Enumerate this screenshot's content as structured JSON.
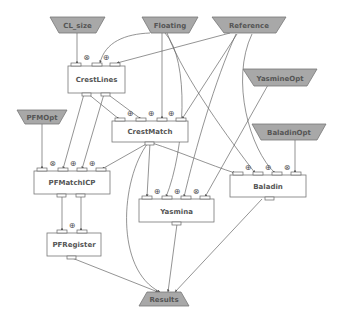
{
  "diagram": {
    "type": "workflow",
    "inputs": [
      {
        "id": "cl_size",
        "label": "CL_size"
      },
      {
        "id": "floating",
        "label": "Floating"
      },
      {
        "id": "reference",
        "label": "Reference"
      },
      {
        "id": "yasmine_opt",
        "label": "YasmineOpt"
      },
      {
        "id": "pfm_opt",
        "label": "PFMOpt"
      },
      {
        "id": "baladin_opt",
        "label": "BaladinOpt"
      }
    ],
    "processors": [
      {
        "id": "crestlines",
        "label": "CrestLines"
      },
      {
        "id": "crestmatch",
        "label": "CrestMatch"
      },
      {
        "id": "pfmatchicp",
        "label": "PFMatchICP"
      },
      {
        "id": "baladin",
        "label": "Baladin"
      },
      {
        "id": "yasmina",
        "label": "Yasmina"
      },
      {
        "id": "pfregister",
        "label": "PFRegister"
      }
    ],
    "outputs": [
      {
        "id": "results",
        "label": "Results"
      }
    ],
    "operators": {
      "cross": "⊗",
      "dot": "⊕"
    },
    "edges": [
      [
        "CL_size",
        "CrestLines"
      ],
      [
        "Floating",
        "CrestLines"
      ],
      [
        "Reference",
        "CrestLines"
      ],
      [
        "CrestLines",
        "CrestMatch"
      ],
      [
        "CrestLines",
        "CrestMatch"
      ],
      [
        "Floating",
        "CrestMatch"
      ],
      [
        "Reference",
        "CrestMatch"
      ],
      [
        "CrestLines",
        "PFMatchICP"
      ],
      [
        "PFMOpt",
        "PFMatchICP"
      ],
      [
        "CrestMatch",
        "PFMatchICP"
      ],
      [
        "CrestMatch",
        "Yasmina"
      ],
      [
        "CrestMatch",
        "Baladin"
      ],
      [
        "Floating",
        "Yasmina"
      ],
      [
        "Reference",
        "Yasmina"
      ],
      [
        "YasmineOpt",
        "Yasmina"
      ],
      [
        "Floating",
        "Baladin"
      ],
      [
        "Reference",
        "Baladin"
      ],
      [
        "BaladinOpt",
        "Baladin"
      ],
      [
        "PFMatchICP",
        "PFRegister"
      ],
      [
        "PFMatchICP",
        "PFRegister"
      ],
      [
        "PFRegister",
        "Results"
      ],
      [
        "Yasmina",
        "Results"
      ],
      [
        "Baladin",
        "Results"
      ],
      [
        "CrestMatch",
        "Results"
      ]
    ]
  },
  "colors": {
    "input_fill": "#a8a8a8",
    "box_stroke": "#777777",
    "edge": "#666666",
    "text": "#555555"
  }
}
